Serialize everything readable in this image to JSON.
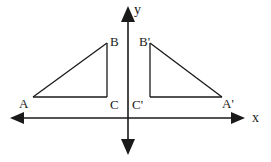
{
  "figure": {
    "background_color": "#ffffff",
    "stroke_color": "#1a1a1a",
    "axes": {
      "x_axis_label": "x",
      "y_axis_label": "y",
      "origin": {
        "x": 128,
        "y": 118
      },
      "x_axis_extent": {
        "from_x": 10,
        "to_x": 245,
        "y": 118
      },
      "y_axis_extent": {
        "x": 128,
        "from_y": 6,
        "to_y": 155
      },
      "arrowheads": [
        "x-negative",
        "x-positive",
        "y-positive",
        "y-negative"
      ]
    },
    "shapes": [
      {
        "name": "triangle-ABC",
        "side": "left",
        "vertices": [
          {
            "label": "A",
            "x": 33,
            "y": 97
          },
          {
            "label": "B",
            "x": 107,
            "y": 43
          },
          {
            "label": "C",
            "x": 107,
            "y": 97
          }
        ],
        "right_angle_at": "C"
      },
      {
        "name": "triangle-A-prime-B-prime-C-prime",
        "side": "right",
        "vertices": [
          {
            "label": "B'",
            "x": 150,
            "y": 43
          },
          {
            "label": "A'",
            "x": 222,
            "y": 97
          },
          {
            "label": "C'",
            "x": 150,
            "y": 97
          }
        ],
        "right_angle_at": "C'"
      }
    ],
    "labels": {
      "A": "A",
      "B": "B",
      "C": "C",
      "A_prime": "A'",
      "B_prime": "B'",
      "C_prime": "C'"
    }
  }
}
